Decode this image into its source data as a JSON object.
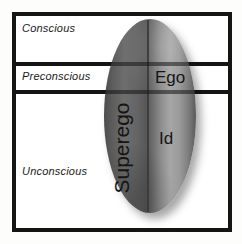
{
  "diagram": {
    "type": "psychoanalytic-iceberg-diagram",
    "levels": [
      {
        "id": "conscious",
        "label": "Conscious"
      },
      {
        "id": "preconscious",
        "label": "Preconscious"
      },
      {
        "id": "unconscious",
        "label": "Unconscious"
      }
    ],
    "structures": [
      {
        "id": "ego",
        "label": "Ego"
      },
      {
        "id": "id",
        "label": "Id"
      },
      {
        "id": "superego",
        "label": "Superego"
      }
    ],
    "colors": {
      "frame": "#151515",
      "background": "#ffffff",
      "ellipse_dark": "#4c4c4c",
      "ellipse_light": "#a6a6a6",
      "text": "#1a1a1a"
    }
  }
}
